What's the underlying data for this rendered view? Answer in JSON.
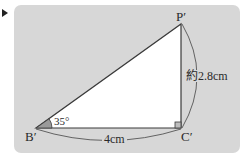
{
  "figure": {
    "type": "right-triangle",
    "vertices": {
      "P": "P′",
      "B": "B′",
      "C": "C′"
    },
    "angle_B": "35°",
    "side_BC": "4cm",
    "side_CP": "約2.8cm",
    "right_angle_at": "C′"
  },
  "colors": {
    "panel": "#d7d7d7",
    "triangle_fill": "#ffffff",
    "stroke": "#3a3a3a",
    "angle_mark": "#9a9a9a",
    "marker": "#222222"
  }
}
